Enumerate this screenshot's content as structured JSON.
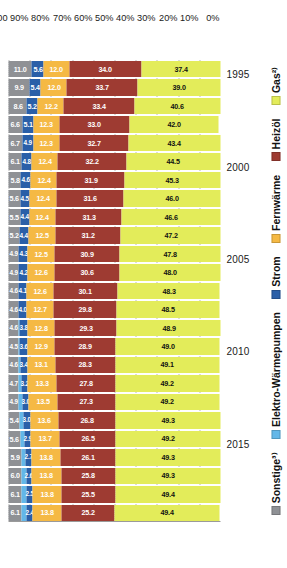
{
  "chart_data": {
    "type": "bar",
    "title": "",
    "subtitle": "",
    "xlabel": "",
    "ylabel": "",
    "ylim": [
      0,
      100
    ],
    "grid": true,
    "legend_position": "bottom",
    "stacked": true,
    "orientation": "vertical-rotated",
    "categories": [
      "1995",
      "1996",
      "1997",
      "1998",
      "1999",
      "2000",
      "2001",
      "2002",
      "2003",
      "2004",
      "2005",
      "2006",
      "2007",
      "2008",
      "2009",
      "2010",
      "2011",
      "2012",
      "2013",
      "2014",
      "2015",
      "2016",
      "2017",
      "2018",
      "2019"
    ],
    "axis_tick_labels_years": [
      "2015",
      "2010",
      "2005",
      "2000",
      "1995"
    ],
    "axis_tick_labels_percent": [
      "0%",
      "10%",
      "20%",
      "30%",
      "40%",
      "50%",
      "60%",
      "70%",
      "80%",
      "90%",
      "100"
    ],
    "series": [
      {
        "name": "Gas²⁾",
        "color": "#e3ec5a",
        "values": [
          37.4,
          39.0,
          40.6,
          42.0,
          43.4,
          44.5,
          45.3,
          46.0,
          46.6,
          47.2,
          47.8,
          48.0,
          48.3,
          48.5,
          48.9,
          49.0,
          49.1,
          49.2,
          49.2,
          49.3,
          49.2,
          49.3,
          49.3,
          49.4,
          49.4
        ]
      },
      {
        "name": "Heizöl",
        "color": "#9e3b32",
        "values": [
          34.0,
          33.7,
          33.4,
          33.0,
          32.7,
          32.2,
          31.9,
          31.6,
          31.3,
          31.2,
          30.9,
          30.6,
          30.1,
          29.8,
          29.3,
          28.9,
          28.3,
          27.8,
          27.3,
          26.8,
          26.5,
          26.1,
          25.8,
          25.5,
          25.2
        ]
      },
      {
        "name": "Fernwärme",
        "color": "#f5b944",
        "values": [
          12.0,
          12.0,
          12.2,
          12.3,
          12.3,
          12.4,
          12.4,
          12.4,
          12.4,
          12.5,
          12.5,
          12.6,
          12.6,
          12.7,
          12.8,
          12.9,
          13.1,
          13.3,
          13.5,
          13.6,
          13.7,
          13.8,
          13.8,
          13.8,
          13.8
        ]
      },
      {
        "name": "Strom",
        "color": "#2a5fa8",
        "values": [
          5.6,
          5.4,
          5.2,
          5.1,
          4.9,
          4.8,
          4.6,
          4.5,
          4.4,
          4.4,
          4.3,
          4.2,
          4.1,
          4.0,
          3.8,
          3.6,
          3.4,
          3.2,
          3.0,
          3.0,
          2.9,
          2.7,
          2.6,
          2.5,
          2.4
        ]
      },
      {
        "name": "Elektro-Wärmepumpen",
        "color": "#63b7e8",
        "values": [
          0.0,
          0.0,
          0.0,
          0.0,
          0.0,
          0.0,
          0.0,
          0.0,
          0.0,
          0.0,
          0.0,
          0.0,
          0.0,
          0.0,
          0.6,
          0.8,
          1.0,
          1.3,
          1.6,
          1.8,
          2.0,
          2.2,
          2.4,
          2.5,
          2.6
        ]
      },
      {
        "name": "Sonstige³⁾",
        "color": "#8f9195",
        "values": [
          11.0,
          9.9,
          8.6,
          6.6,
          6.7,
          6.1,
          5.8,
          5.6,
          5.5,
          5.2,
          4.9,
          4.9,
          4.6,
          4.6,
          4.6,
          4.5,
          4.6,
          4.7,
          4.9,
          5.4,
          5.6,
          5.9,
          6.0,
          6.1,
          6.1
        ]
      }
    ],
    "segment_labels": {
      "gas": [
        "37.4",
        "39.0",
        "40.6",
        "42.0",
        "43.4",
        "44.5",
        "45.3",
        "46.0",
        "46.6",
        "47.2",
        "47.8",
        "48.0",
        "48.3",
        "48.5",
        "48.9",
        "49.0",
        "49.1",
        "49.2",
        "49.2",
        "49.3",
        "49.2",
        "49.3",
        "49.3",
        "49.4",
        "49.4"
      ],
      "heizoel": [
        "34.0",
        "33.7",
        "33.4",
        "33.0",
        "32.7",
        "32.2",
        "31.9",
        "31.6",
        "31.3",
        "31.2",
        "30.9",
        "30.6",
        "30.1",
        "29.8",
        "29.3",
        "28.9",
        "28.3",
        "27.8",
        "27.3",
        "26.8",
        "26.5",
        "26.1",
        "25.8",
        "25.5",
        "25.2"
      ],
      "fernwaerme": [
        "12.0",
        "12.0",
        "12.2",
        "12.3",
        "12.3",
        "12.4",
        "12.4",
        "12.4",
        "12.4",
        "12.5",
        "12.5",
        "12.6",
        "12.6",
        "12.7",
        "12.8",
        "12.9",
        "13.1",
        "13.3",
        "13.5",
        "13.6",
        "13.7",
        "13.8",
        "13.8",
        "13.8",
        "13.8"
      ],
      "strom": [
        "5.6",
        "5.4",
        "5.2",
        "5.1",
        "4.9",
        "4.8",
        "4.6",
        "4.5",
        "4.4",
        "4.4",
        "4.3",
        "4.2",
        "4.1",
        "4.0",
        "3.8",
        "3.6",
        "3.4",
        "3.2",
        "3.0",
        "3.0",
        "2.9",
        "2.7",
        "2.6",
        "2.5",
        "2.4"
      ],
      "waermepumpen": [
        "",
        "",
        "",
        "",
        "",
        "",
        "",
        "",
        "",
        "",
        "",
        "",
        "",
        "",
        "",
        "",
        "",
        "",
        "",
        "",
        "",
        "",
        "",
        "",
        ""
      ],
      "sonstige": [
        "11.0",
        "9.9",
        "8.6",
        "6.6",
        "6.7",
        "6.1",
        "5.8",
        "5.6",
        "5.5",
        "5.2",
        "4.9",
        "4.9",
        "4.6",
        "4.6",
        "4.6",
        "4.5",
        "4.6",
        "4.7",
        "4.9",
        "5.4",
        "5.6",
        "5.9",
        "6.0",
        "6.1",
        "6.1"
      ]
    }
  },
  "legend": {
    "items": [
      {
        "label": "Gas²⁾",
        "color": "#e3ec5a"
      },
      {
        "label": "Heizöl",
        "color": "#9e3b32"
      },
      {
        "label": "Fernwärme",
        "color": "#f5b944"
      },
      {
        "label": "Strom",
        "color": "#2a5fa8"
      },
      {
        "label": "Elektro-Wärmepumpen",
        "color": "#63b7e8"
      },
      {
        "label": "Sonstige³⁾",
        "color": "#8f9195"
      }
    ]
  },
  "axes": {
    "percent_ticks": [
      "0%",
      "10%",
      "20%",
      "30%",
      "40%",
      "50%",
      "60%",
      "70%",
      "80%",
      "90%",
      "100"
    ],
    "year_ticks": [
      "1995",
      "2000",
      "2005",
      "2010",
      "2015"
    ]
  },
  "colors": {
    "gas": "#e3ec5a",
    "heizoel": "#9e3b32",
    "fernwaerme": "#f5b944",
    "strom": "#2a5fa8",
    "waermepumpen": "#63b7e8",
    "sonstige": "#8f9195",
    "background": "#ffffff",
    "text": "#1a1a1a",
    "grid": "#b9b9b9"
  }
}
